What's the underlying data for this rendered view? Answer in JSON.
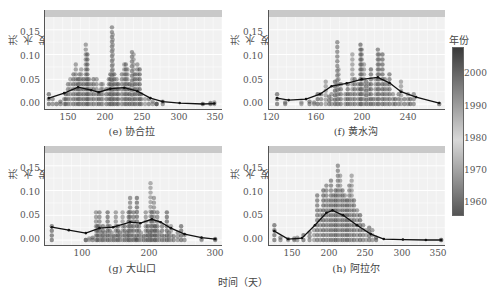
{
  "figure": {
    "shared_xlabel": "时间（天）",
    "legend": {
      "title": "年份",
      "ticks": [
        "2000",
        "1990",
        "1980",
        "1970",
        "1960"
      ],
      "colors": {
        "top": "#3a3a3a",
        "middle": "#d8d8d8",
        "bottom": "#555555"
      }
    }
  },
  "chart_data": [
    {
      "type": "scatter",
      "title": "(e) 协合拉",
      "ylabel": "洪水发生率",
      "xlabel": "时间（天）",
      "xticks": [
        "150",
        "200",
        "250",
        "300",
        "350"
      ],
      "yticks": [
        "0.00",
        "0.05",
        "0.10",
        "0.15"
      ],
      "xlim": [
        125,
        355
      ],
      "ylim": [
        -0.01,
        0.19
      ],
      "grid": true,
      "color_by": "年份",
      "points": [
        [
          130,
          0.02
        ],
        [
          135,
          0.01
        ],
        [
          140,
          0.0
        ],
        [
          145,
          0.005
        ],
        [
          150,
          0.01
        ],
        [
          152,
          0.02
        ],
        [
          155,
          0.04
        ],
        [
          158,
          0.05
        ],
        [
          162,
          0.06
        ],
        [
          165,
          0.08
        ],
        [
          168,
          0.05
        ],
        [
          170,
          0.06
        ],
        [
          172,
          0.07
        ],
        [
          175,
          0.05
        ],
        [
          178,
          0.12
        ],
        [
          180,
          0.1
        ],
        [
          182,
          0.05
        ],
        [
          185,
          0.04
        ],
        [
          188,
          0.05
        ],
        [
          192,
          0.05
        ],
        [
          195,
          0.02
        ],
        [
          198,
          0.04
        ],
        [
          200,
          0.04
        ],
        [
          205,
          0.03
        ],
        [
          208,
          0.05
        ],
        [
          210,
          0.06
        ],
        [
          212,
          0.155
        ],
        [
          213,
          0.14
        ],
        [
          215,
          0.06
        ],
        [
          218,
          0.05
        ],
        [
          220,
          0.04
        ],
        [
          225,
          0.06
        ],
        [
          228,
          0.08
        ],
        [
          230,
          0.08
        ],
        [
          232,
          0.07
        ],
        [
          235,
          0.04
        ],
        [
          238,
          0.105
        ],
        [
          240,
          0.1
        ],
        [
          242,
          0.06
        ],
        [
          245,
          0.08
        ],
        [
          248,
          0.07
        ],
        [
          250,
          0.02
        ],
        [
          255,
          0.01
        ],
        [
          260,
          0.01
        ],
        [
          265,
          0.005
        ],
        [
          270,
          0.0
        ],
        [
          278,
          0.005
        ],
        [
          330,
          0.0
        ],
        [
          340,
          0.002
        ],
        [
          345,
          0.003
        ]
      ],
      "trend_line": {
        "x": [
          130,
          150,
          168,
          185,
          195,
          210,
          228,
          245,
          262,
          278,
          300,
          330,
          345
        ],
        "y": [
          0.012,
          0.022,
          0.034,
          0.028,
          0.024,
          0.031,
          0.033,
          0.026,
          0.012,
          0.005,
          0.002,
          0.0,
          0.001
        ]
      }
    },
    {
      "type": "scatter",
      "title": "(f) 黄水沟",
      "ylabel": "洪水发生率",
      "xlabel": "时间（天）",
      "xticks": [
        "120",
        "160",
        "200",
        "240"
      ],
      "yticks": [
        "0.00",
        "0.05",
        "0.10",
        "0.15"
      ],
      "xlim": [
        118,
        270
      ],
      "ylim": [
        -0.01,
        0.19
      ],
      "grid": true,
      "color_by": "年份",
      "points": [
        [
          125,
          0.02
        ],
        [
          132,
          0.003
        ],
        [
          146,
          0.003
        ],
        [
          153,
          0.005
        ],
        [
          157,
          0.003
        ],
        [
          160,
          0.02
        ],
        [
          163,
          0.02
        ],
        [
          167,
          0.045
        ],
        [
          170,
          0.015
        ],
        [
          172,
          0.02
        ],
        [
          175,
          0.045
        ],
        [
          177,
          0.125
        ],
        [
          178,
          0.07
        ],
        [
          180,
          0.04
        ],
        [
          184,
          0.02
        ],
        [
          186,
          0.04
        ],
        [
          188,
          0.02
        ],
        [
          190,
          0.1
        ],
        [
          192,
          0.05
        ],
        [
          195,
          0.04
        ],
        [
          197,
          0.12
        ],
        [
          198,
          0.11
        ],
        [
          200,
          0.08
        ],
        [
          202,
          0.045
        ],
        [
          204,
          0.04
        ],
        [
          206,
          0.07
        ],
        [
          208,
          0.01
        ],
        [
          210,
          0.05
        ],
        [
          212,
          0.11
        ],
        [
          213,
          0.1
        ],
        [
          216,
          0.1
        ],
        [
          218,
          0.05
        ],
        [
          220,
          0.04
        ],
        [
          222,
          0.06
        ],
        [
          225,
          0.02
        ],
        [
          227,
          0.01
        ],
        [
          230,
          0.02
        ],
        [
          232,
          0.045
        ],
        [
          235,
          0.01
        ],
        [
          238,
          0.02
        ],
        [
          240,
          0.01
        ],
        [
          243,
          0.02
        ],
        [
          265,
          0.0
        ]
      ],
      "trend_line": {
        "x": [
          125,
          135,
          150,
          162,
          172,
          185,
          198,
          212,
          222,
          232,
          245,
          265
        ],
        "y": [
          0.012,
          0.008,
          0.01,
          0.02,
          0.036,
          0.042,
          0.05,
          0.054,
          0.043,
          0.025,
          0.014,
          0.002
        ]
      }
    },
    {
      "type": "scatter",
      "title": "(g) 大山口",
      "ylabel": "洪水发生率",
      "xlabel": "时间（天）",
      "xticks": [
        "100",
        "200",
        "300"
      ],
      "yticks": [
        "0.00",
        "0.05",
        "0.10",
        "0.15"
      ],
      "xlim": [
        45,
        305
      ],
      "ylim": [
        -0.01,
        0.19
      ],
      "grid": true,
      "color_by": "年份",
      "points": [
        [
          55,
          0.028
        ],
        [
          105,
          0.0
        ],
        [
          110,
          0.003
        ],
        [
          115,
          0.005
        ],
        [
          120,
          0.056
        ],
        [
          122,
          0.028
        ],
        [
          125,
          0.056
        ],
        [
          128,
          0.015
        ],
        [
          130,
          0.028
        ],
        [
          133,
          0.015
        ],
        [
          137,
          0.056
        ],
        [
          140,
          0.028
        ],
        [
          143,
          0.015
        ],
        [
          146,
          0.008
        ],
        [
          149,
          0.056
        ],
        [
          152,
          0.028
        ],
        [
          155,
          0.015
        ],
        [
          159,
          0.056
        ],
        [
          162,
          0.028
        ],
        [
          165,
          0.015
        ],
        [
          168,
          0.056
        ],
        [
          170,
          0.085
        ],
        [
          172,
          0.028
        ],
        [
          175,
          0.056
        ],
        [
          178,
          0.003
        ],
        [
          180,
          0.085
        ],
        [
          183,
          0.028
        ],
        [
          186,
          0.015
        ],
        [
          190,
          0.008
        ],
        [
          193,
          0.056
        ],
        [
          196,
          0.028
        ],
        [
          199,
          0.015
        ],
        [
          200,
          0.115
        ],
        [
          202,
          0.056
        ],
        [
          205,
          0.085
        ],
        [
          207,
          0.028
        ],
        [
          210,
          0.056
        ],
        [
          213,
          0.015
        ],
        [
          217,
          0.028
        ],
        [
          220,
          0.008
        ],
        [
          224,
          0.056
        ],
        [
          227,
          0.015
        ],
        [
          230,
          0.028
        ],
        [
          234,
          0.008
        ],
        [
          240,
          0.015
        ],
        [
          245,
          0.028
        ],
        [
          250,
          0.01
        ],
        [
          275,
          0.002
        ],
        [
          295,
          0.002
        ]
      ],
      "trend_line": {
        "x": [
          55,
          80,
          105,
          125,
          145,
          170,
          185,
          202,
          215,
          230,
          250,
          275,
          295
        ],
        "y": [
          0.026,
          0.02,
          0.014,
          0.024,
          0.026,
          0.036,
          0.034,
          0.042,
          0.036,
          0.024,
          0.012,
          0.005,
          0.002
        ]
      }
    },
    {
      "type": "scatter",
      "title": "(h) 阿拉尔",
      "ylabel": "洪水发生率",
      "xlabel": "时间（天）",
      "xticks": [
        "150",
        "200",
        "250",
        "300",
        "350"
      ],
      "yticks": [
        "0.00",
        "0.05",
        "0.10",
        "0.15"
      ],
      "xlim": [
        125,
        355
      ],
      "ylim": [
        -0.01,
        0.19
      ],
      "grid": true,
      "color_by": "年份",
      "points": [
        [
          132,
          0.03
        ],
        [
          140,
          0.005
        ],
        [
          150,
          0.002
        ],
        [
          158,
          0.003
        ],
        [
          162,
          0.005
        ],
        [
          170,
          0.01
        ],
        [
          178,
          0.015
        ],
        [
          184,
          0.02
        ],
        [
          188,
          0.09
        ],
        [
          192,
          0.06
        ],
        [
          196,
          0.1
        ],
        [
          200,
          0.11
        ],
        [
          203,
          0.08
        ],
        [
          206,
          0.12
        ],
        [
          209,
          0.09
        ],
        [
          212,
          0.1
        ],
        [
          215,
          0.15
        ],
        [
          218,
          0.13
        ],
        [
          221,
          0.1
        ],
        [
          224,
          0.09
        ],
        [
          227,
          0.08
        ],
        [
          230,
          0.11
        ],
        [
          233,
          0.13
        ],
        [
          236,
          0.08
        ],
        [
          240,
          0.06
        ],
        [
          244,
          0.05
        ],
        [
          248,
          0.03
        ],
        [
          252,
          0.02
        ],
        [
          256,
          0.025
        ],
        [
          260,
          0.02
        ],
        [
          265,
          0.005
        ],
        [
          350,
          0.0
        ]
      ],
      "trend_line": {
        "x": [
          132,
          150,
          168,
          185,
          200,
          208,
          222,
          240,
          258,
          275,
          300,
          330,
          350
        ],
        "y": [
          0.018,
          0.002,
          0.004,
          0.03,
          0.055,
          0.06,
          0.05,
          0.03,
          0.012,
          0.002,
          0.001,
          0.0,
          0.0
        ]
      }
    }
  ]
}
